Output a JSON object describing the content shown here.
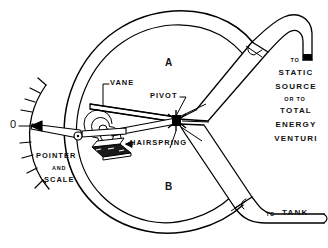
{
  "diagram": {
    "ink_color": "#000000",
    "background_color": "#ffffff"
  },
  "labels": {
    "chamber_a": "A",
    "chamber_b": "B",
    "vane": "VANE",
    "pivot": "PIVOT",
    "hairspring": "HAIRSPRING",
    "pointer_line1": "POINTER",
    "pointer_line2": "AND",
    "pointer_line3": "SCALE",
    "zero": "0",
    "to_tank_small": "TO",
    "to_tank_main": "TANK",
    "static_line1": "TO",
    "static_line2": "STATIC",
    "static_line3": "SOURCE",
    "static_line4": "OR TO",
    "static_line5": "TOTAL",
    "static_line6": "ENERGY",
    "static_line7": "VENTURI"
  },
  "parts": [
    {
      "name": "casing-outer-wall",
      "type": "arc"
    },
    {
      "name": "casing-inner-wall",
      "type": "arc"
    },
    {
      "name": "vane-blade",
      "type": "quadrilateral"
    },
    {
      "name": "pivot-point",
      "type": "node"
    },
    {
      "name": "hairspring-coil",
      "type": "spiral",
      "turns": 5
    },
    {
      "name": "hairspring-mount",
      "type": "bracket"
    },
    {
      "name": "pointer-needle",
      "type": "tapered-bar"
    },
    {
      "name": "scale-arc",
      "type": "arc",
      "tick_count": 9
    },
    {
      "name": "upper-duct",
      "type": "funnel"
    },
    {
      "name": "lower-duct",
      "type": "funnel"
    },
    {
      "name": "upper-pipe",
      "type": "pipe",
      "destination": "static-source"
    },
    {
      "name": "lower-pipe",
      "type": "pipe",
      "destination": "tank"
    }
  ]
}
